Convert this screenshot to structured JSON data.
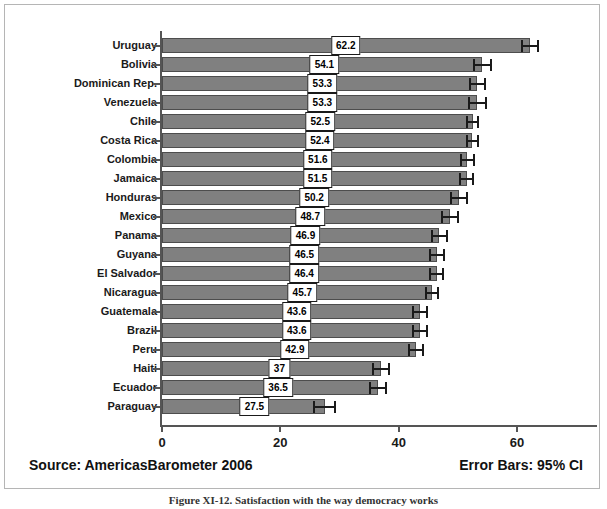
{
  "figure": {
    "caption": "Figure XI-12.  Satisfaction with the way democracy works",
    "source_note": "Source: AmericasBarometer  2006",
    "error_note": "Error Bars: 95% CI"
  },
  "chart_data": {
    "type": "bar",
    "orientation": "horizontal",
    "title": "",
    "xlabel": "",
    "ylabel": "",
    "xlim": [
      0,
      72
    ],
    "grid": false,
    "legend": null,
    "xticks": [
      0,
      20,
      40,
      60
    ],
    "xticklabels": [
      "0",
      "20",
      "40",
      "60"
    ],
    "error_bar_type": "95% CI",
    "categories": [
      "Uruguay",
      "Bolivia",
      "Dominican Rep.",
      "Venezuela",
      "Chile",
      "Costa Rica",
      "Colombia",
      "Jamaica",
      "Honduras",
      "Mexico",
      "Panama",
      "Guyana",
      "El Salvador",
      "Nicaragua",
      "Guatemala",
      "Brazil",
      "Peru",
      "Haiti",
      "Ecuador",
      "Paraguay"
    ],
    "values": [
      62.2,
      54.1,
      53.3,
      53.3,
      52.5,
      52.4,
      51.6,
      51.5,
      50.2,
      48.7,
      46.9,
      46.5,
      46.4,
      45.7,
      43.6,
      43.6,
      42.9,
      37,
      36.5,
      27.5
    ],
    "value_labels": [
      "62.2",
      "54.1",
      "53.3",
      "53.3",
      "52.5",
      "52.4",
      "51.6",
      "51.5",
      "50.2",
      "48.7",
      "46.9",
      "46.5",
      "46.4",
      "45.7",
      "43.6",
      "43.6",
      "42.9",
      "37",
      "36.5",
      "27.5"
    ],
    "errors": [
      1.5,
      1.6,
      1.4,
      1.6,
      1.1,
      1.1,
      1.3,
      1.3,
      1.5,
      1.5,
      1.5,
      1.4,
      1.3,
      1.2,
      1.3,
      1.3,
      1.3,
      1.5,
      1.5,
      1.9
    ],
    "colors": {
      "bar_fill": "#808080",
      "bar_edge": "#4d4d4d",
      "axis": "#555555",
      "error_bar": "#1a1a1a",
      "label_box_bg": "#ffffff",
      "label_box_border": "#1a1a1a",
      "text": "#1a1a1a",
      "frame": "#b5b5b5",
      "background": "#ffffff"
    }
  }
}
